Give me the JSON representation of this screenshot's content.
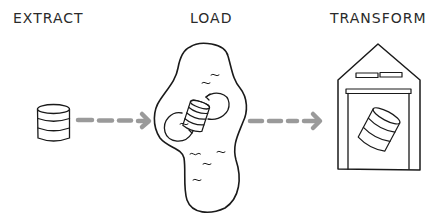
{
  "stages": [
    {
      "id": "extract",
      "label": "EXTRACT"
    },
    {
      "id": "load",
      "label": "LOAD"
    },
    {
      "id": "transform",
      "label": "TRANSFORM"
    }
  ],
  "icons": {
    "extract": "database-icon",
    "load": "data-lake-icon",
    "transform": "warehouse-icon"
  },
  "colors": {
    "stroke": "#1a1a1a",
    "arrow": "#9a9a9a",
    "text": "#2a2a2a",
    "background": "#ffffff"
  }
}
